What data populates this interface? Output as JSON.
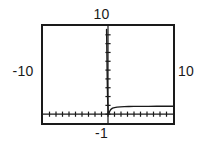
{
  "viewport": {
    "top_label": "10",
    "bottom_label": "-1",
    "left_label": "-10",
    "right_label": "10"
  },
  "chart_data": {
    "type": "line",
    "title": "",
    "xlabel": "",
    "ylabel": "",
    "xlim": [
      -10,
      10
    ],
    "ylim": [
      -1,
      10
    ],
    "grid": false,
    "legend": null,
    "axes": {
      "x_axis_y_value": 0,
      "y_axis_x_value": 0,
      "x_tick_interval": 1,
      "y_tick_interval": 1,
      "x_tick_count": 20,
      "y_tick_count": 11
    },
    "annotations": [
      "vertical asymptote at x = 0",
      "horizontal asymptote at y = 0.9"
    ],
    "series": [
      {
        "name": "curve",
        "x": [
          -0.22,
          -0.2,
          -0.18,
          -0.16,
          -0.14,
          -0.12,
          -0.1,
          -0.05,
          0.02,
          0.05,
          0.08,
          0.12,
          0.18,
          0.25,
          0.35,
          0.5,
          0.7,
          1.0,
          1.4,
          1.9,
          2.5,
          3.2,
          4.0,
          5.0,
          6.2,
          7.5,
          9.0,
          10.0
        ],
        "y": [
          9.6,
          8.7,
          7.6,
          6.5,
          5.4,
          4.3,
          3.3,
          1.6,
          0.4,
          0.05,
          0.0,
          0.05,
          0.15,
          0.3,
          0.45,
          0.58,
          0.68,
          0.75,
          0.8,
          0.83,
          0.855,
          0.87,
          0.88,
          0.885,
          0.89,
          0.895,
          0.9,
          0.9
        ]
      }
    ]
  }
}
